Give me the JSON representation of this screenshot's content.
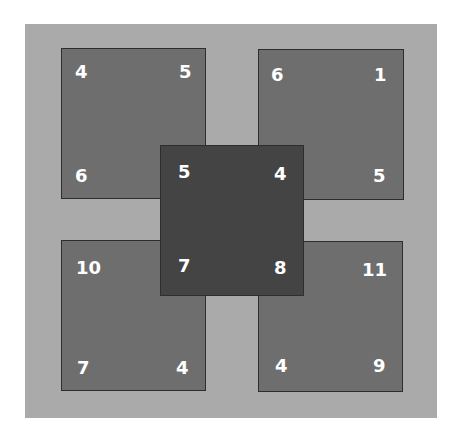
{
  "diagram": {
    "colors": {
      "background": "#aaaaaa",
      "outer_square": "#6e6e6e",
      "center_square": "#444444",
      "border": "#2e2e2e",
      "text": "#ffffff"
    },
    "squares": {
      "top_left": {
        "top_left": "4",
        "top_right": "5",
        "bottom_left": "6",
        "bottom_right": ""
      },
      "top_right": {
        "top_left": "6",
        "top_right": "1",
        "bottom_left": "",
        "bottom_right": "5"
      },
      "bottom_left": {
        "top_left": "10",
        "top_right": "",
        "bottom_left": "7",
        "bottom_right": "4"
      },
      "bottom_right": {
        "top_left": "",
        "top_right": "11",
        "bottom_left": "4",
        "bottom_right": "9"
      },
      "center": {
        "top_left": "5",
        "top_right": "4",
        "bottom_left": "7",
        "bottom_right": "8"
      }
    }
  }
}
